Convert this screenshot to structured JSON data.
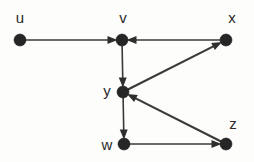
{
  "figure": {
    "background_color": "#fdfdfb",
    "ink_color": "#2e2e2e",
    "width": 254,
    "height": 162
  },
  "graph": {
    "type": "directed-graph",
    "node_radius": 6,
    "nodes": [
      {
        "id": "u",
        "label": "u",
        "cx": 20,
        "cy": 40,
        "label_x": 20,
        "label_y": 17
      },
      {
        "id": "v",
        "label": "v",
        "cx": 122,
        "cy": 40,
        "label_x": 123,
        "label_y": 17
      },
      {
        "id": "x",
        "label": "x",
        "cx": 226,
        "cy": 40,
        "label_x": 232,
        "label_y": 17
      },
      {
        "id": "y",
        "label": "y",
        "cx": 123,
        "cy": 92,
        "label_x": 107,
        "label_y": 90
      },
      {
        "id": "w",
        "label": "w",
        "cx": 124,
        "cy": 144,
        "label_x": 107,
        "label_y": 144
      },
      {
        "id": "z",
        "label": "z",
        "cx": 226,
        "cy": 144,
        "label_x": 233,
        "label_y": 123
      }
    ],
    "edges": [
      {
        "id": "u-v",
        "from": "u",
        "to": "v",
        "directed": true,
        "style": "straight"
      },
      {
        "id": "x-v",
        "from": "x",
        "to": "v",
        "directed": true,
        "style": "straight"
      },
      {
        "id": "v-y",
        "from": "v",
        "to": "y",
        "directed": true,
        "style": "straight"
      },
      {
        "id": "y-x",
        "from": "y",
        "to": "x",
        "directed": true,
        "style": "straight"
      },
      {
        "id": "y-w",
        "from": "y",
        "to": "w",
        "directed": true,
        "style": "straight"
      },
      {
        "id": "z-y",
        "from": "z",
        "to": "y",
        "directed": true,
        "style": "straight"
      },
      {
        "id": "w-z",
        "from": "w",
        "to": "z",
        "directed": true,
        "style": "straight"
      }
    ]
  }
}
